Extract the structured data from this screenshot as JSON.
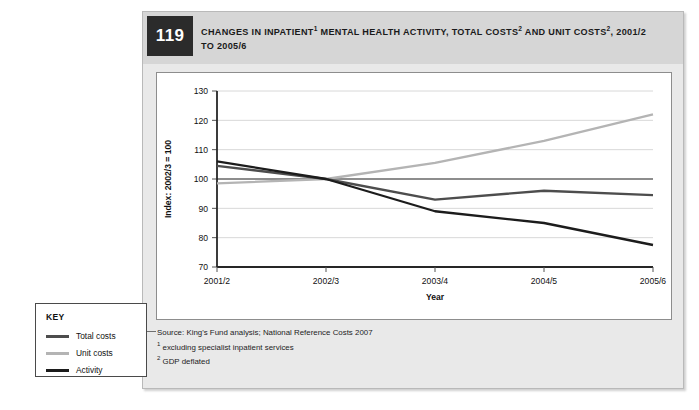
{
  "figure": {
    "number": "119",
    "title_line1_a": "CHANGES IN INPATIENT",
    "title_sup1": "1",
    "title_line1_b": " MENTAL HEALTH ACTIVITY, TOTAL COSTS",
    "title_sup2": "2",
    "title_line1_c": " AND UNIT COSTS",
    "title_sup3": "2",
    "title_line1_d": ", 2001/2",
    "title_line2": "TO 2005/6",
    "title_full": "CHANGES IN INPATIENT1 MENTAL HEALTH ACTIVITY, TOTAL COSTS2 AND UNIT COSTS2, 2001/2 TO 2005/6"
  },
  "source": {
    "line1": "Source: King's Fund analysis; National Reference Costs 2007",
    "note1_marker": "1",
    "note1": " excluding specialist inpatient services",
    "note2_marker": "2",
    "note2": " GDP deflated"
  },
  "key": {
    "title": "KEY",
    "items": [
      {
        "label": "Total costs",
        "color": "#4d4d4d"
      },
      {
        "label": "Unit costs",
        "color": "#b4b4b4"
      },
      {
        "label": "Activity",
        "color": "#1c1c1c"
      }
    ]
  },
  "chart_data": {
    "type": "line",
    "xlabel": "Year",
    "ylabel": "Index: 2002/3 = 100",
    "categories": [
      "2001/2",
      "2002/3",
      "2003/4",
      "2004/5",
      "2005/6"
    ],
    "ylim": [
      70,
      130
    ],
    "yticks": [
      70,
      80,
      90,
      100,
      110,
      120,
      130
    ],
    "grid": true,
    "reference_line": 100,
    "legend_position": "external-left",
    "series": [
      {
        "name": "Total costs",
        "color": "#4d4d4d",
        "values": [
          104.5,
          100,
          93.0,
          96.0,
          94.5
        ]
      },
      {
        "name": "Unit costs",
        "color": "#b4b4b4",
        "values": [
          98.5,
          100,
          105.5,
          113.0,
          122.0
        ]
      },
      {
        "name": "Activity",
        "color": "#1c1c1c",
        "values": [
          106.0,
          100,
          89.0,
          85.0,
          77.5
        ]
      }
    ]
  }
}
